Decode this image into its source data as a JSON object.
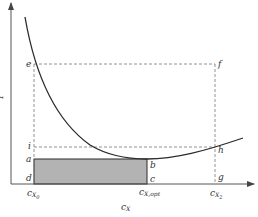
{
  "diagram": {
    "type": "cost-curve",
    "axes": {
      "x_label": "c",
      "x_label_sub": "X",
      "y_label": "Y"
    },
    "points": {
      "a": "a",
      "b": "b",
      "c": "c",
      "d": "d",
      "e": "e",
      "f": "f",
      "g": "g",
      "h": "h",
      "i": "i"
    },
    "ticks": [
      {
        "base": "c",
        "sub": "X",
        "subsub": "0"
      },
      {
        "base": "c",
        "sub": "X,opt"
      },
      {
        "base": "c",
        "sub": "X",
        "subsub": "2"
      }
    ],
    "colors": {
      "curve": "#2a2a2a",
      "axis": "#555555",
      "dashed": "#777777",
      "shaded": "#b3b3b3",
      "rect_border": "#2a2a2a"
    }
  }
}
